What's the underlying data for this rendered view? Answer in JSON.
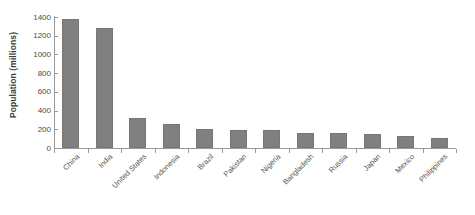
{
  "chart_data": {
    "type": "bar",
    "title": "",
    "xlabel": "",
    "ylabel": "Population (millions)",
    "categories": [
      "China",
      "India",
      "United States",
      "Indonesia",
      "Brazil",
      "Pakistan",
      "Nigeria",
      "Bangladesh",
      "Russia",
      "Japan",
      "Mexico",
      "Philippines"
    ],
    "values": [
      1380,
      1280,
      320,
      255,
      208,
      195,
      190,
      165,
      160,
      145,
      128,
      110
    ],
    "ylim": [
      0,
      1400
    ],
    "yticks": [
      0,
      200,
      400,
      600,
      800,
      1000,
      1200,
      1400
    ],
    "ytick_labels": [
      "0",
      "200",
      "400",
      "600",
      "800",
      "1000",
      "1200",
      "1400"
    ],
    "grid": false,
    "legend": null,
    "bar_color": "#808080",
    "axis_color": "#9a9a9a",
    "background": "#ffffff"
  }
}
